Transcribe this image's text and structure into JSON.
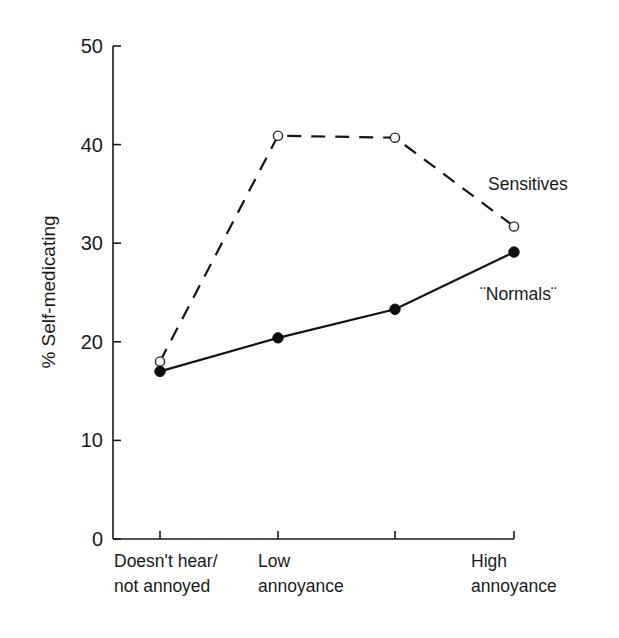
{
  "chart_data": {
    "type": "line",
    "title": "",
    "xlabel": "",
    "ylabel": "% Self-medicating",
    "ylim": [
      0,
      50
    ],
    "yticks": [
      0,
      10,
      20,
      30,
      40,
      50
    ],
    "ytick_labels": [
      "0",
      "10",
      "20",
      "30",
      "40",
      "50"
    ],
    "grid": false,
    "legend_position": "inline labels at right end of lines",
    "categories": [
      "Doesn't hear/ not annoyed",
      "Low annoyance",
      "",
      "High annoyance"
    ],
    "category_labels": [
      {
        "line1": "Doesn't hear/",
        "line2": "not annoyed"
      },
      {
        "line1": "Low",
        "line2": "annoyance"
      },
      {
        "line1": "",
        "line2": ""
      },
      {
        "line1": "High",
        "line2": "annoyance"
      }
    ],
    "series": [
      {
        "name": "Sensitives",
        "label": "Sensitives",
        "style": "dashed",
        "marker": "open-circle",
        "values": [
          18.0,
          40.9,
          40.7,
          31.7
        ]
      },
      {
        "name": "Normals",
        "label": "¨Normals¨",
        "style": "solid",
        "marker": "filled-circle",
        "values": [
          17.0,
          20.4,
          23.3,
          29.1
        ]
      }
    ],
    "colors": {
      "axis": "#1a1a1a",
      "line": "#141414",
      "background": "#ffffff"
    }
  }
}
